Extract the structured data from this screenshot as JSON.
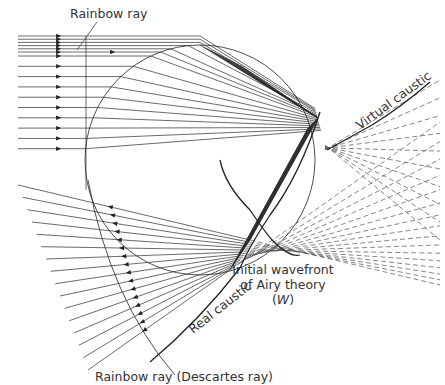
{
  "figure": {
    "labels": {
      "rainbow_ray": "Rainbow ray",
      "virtual_caustic": "Virtual caustic",
      "real_caustic": "Real caustic",
      "wavefront_line1": "Initial wavefront",
      "wavefront_line2": "of Airy theory",
      "wavefront_line3_open": "(",
      "wavefront_symbol": "W",
      "wavefront_line3_close": ")",
      "descartes_ray": "Rainbow ray (Descartes ray)"
    },
    "colors": {
      "line": "#2b2b2b",
      "dashed": "#555555",
      "text": "#333333",
      "background": "#ffffff"
    },
    "incoming_ray_count": 16,
    "emergent_ray_count": 16
  }
}
